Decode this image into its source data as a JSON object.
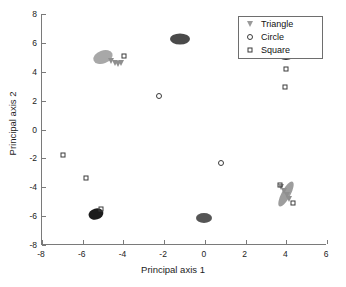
{
  "chart_data": {
    "type": "scatter",
    "title": "",
    "xlabel": "Principal axis 1",
    "ylabel": "Principal axis 2",
    "xlim": [
      -8,
      6
    ],
    "ylim": [
      -8,
      8
    ],
    "xticks": [
      -8,
      -6,
      -4,
      -2,
      0,
      2,
      4,
      6
    ],
    "xticklabels": [
      "-8",
      "-6",
      "-4",
      "-2",
      "0",
      "2",
      "4",
      "6"
    ],
    "yticks": [
      -8,
      -6,
      -4,
      -2,
      0,
      2,
      4,
      6,
      8
    ],
    "yticklabels": [
      "-8",
      "-6",
      "-4",
      "-2",
      "0",
      "2",
      "4",
      "6",
      "8"
    ],
    "grid": false,
    "legend_position": "upper right",
    "legend": [
      {
        "label": "Triangle",
        "marker": "triangle-down"
      },
      {
        "label": "Circle",
        "marker": "circle"
      },
      {
        "label": "Square",
        "marker": "square"
      }
    ],
    "series": [
      {
        "name": "Triangle",
        "marker": "triangle-down",
        "points": [
          {
            "x": -4.55,
            "y": 4.75
          },
          {
            "x": -4.35,
            "y": 4.62
          },
          {
            "x": -4.2,
            "y": 4.55
          },
          {
            "x": -4.05,
            "y": 4.6
          },
          {
            "x": 3.8,
            "y": -3.95
          },
          {
            "x": 3.95,
            "y": -4.25
          },
          {
            "x": 4.1,
            "y": -4.55
          },
          {
            "x": 4.2,
            "y": -4.8
          }
        ]
      },
      {
        "name": "Circle",
        "marker": "circle",
        "points": [
          {
            "x": -2.2,
            "y": 2.35
          },
          {
            "x": 0.85,
            "y": -2.3
          }
        ]
      },
      {
        "name": "Square",
        "marker": "square",
        "points": [
          {
            "x": -3.9,
            "y": 5.1
          },
          {
            "x": 4.05,
            "y": 4.2
          },
          {
            "x": 4.0,
            "y": 2.95
          },
          {
            "x": -6.9,
            "y": -1.8
          },
          {
            "x": -5.8,
            "y": -3.35
          },
          {
            "x": -5.05,
            "y": -5.48
          },
          {
            "x": 4.4,
            "y": -5.1
          },
          {
            "x": 3.72,
            "y": -3.82
          }
        ]
      }
    ],
    "clusters": [
      {
        "name": "gray-cluster-upper-left",
        "x": -4.95,
        "y": 5.0,
        "w": 20,
        "h": 13,
        "color": "#a8a8a8",
        "angle": -20
      },
      {
        "name": "dark-cluster-top-center",
        "x": -1.15,
        "y": 6.3,
        "w": 20,
        "h": 11,
        "color": "#4a4a4a",
        "angle": 0
      },
      {
        "name": "dark-cluster-top-right",
        "x": 4.02,
        "y": 5.15,
        "w": 17,
        "h": 10,
        "color": "#333333",
        "angle": 0
      },
      {
        "name": "black-cluster-lower-left",
        "x": -5.28,
        "y": -5.82,
        "w": 15,
        "h": 11,
        "color": "#1c1c1c",
        "angle": -15
      },
      {
        "name": "dark-cluster-bottom-center",
        "x": 0.0,
        "y": -6.12,
        "w": 16,
        "h": 10,
        "color": "#555555",
        "angle": 0
      },
      {
        "name": "gray-streak-lower-right",
        "x": 4.05,
        "y": -4.45,
        "w": 9,
        "h": 28,
        "color": "#9d9d9d",
        "angle": 28
      }
    ]
  }
}
